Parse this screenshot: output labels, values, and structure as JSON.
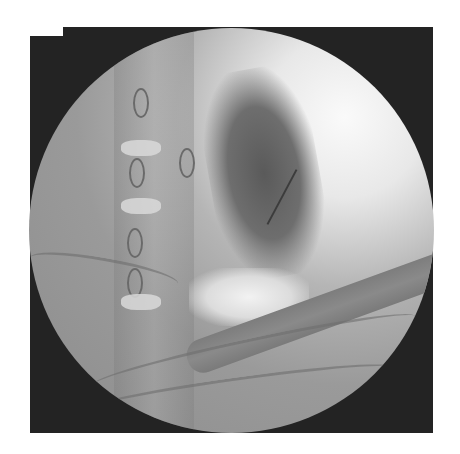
{
  "image": {
    "type": "fluoroscopy",
    "description": "Circular fluoroscopic field of view showing cervicothoracic spine, a dark contrast-filled region with a thin wire, bright lung apex area and crossing clavicle/rib shadows",
    "colors": {
      "background": "#ffffff",
      "frame": "#232323",
      "field_bright": "#fafafa",
      "field_mid": "#9a9a9a",
      "contrast_dark": "#5a5a5a"
    }
  }
}
